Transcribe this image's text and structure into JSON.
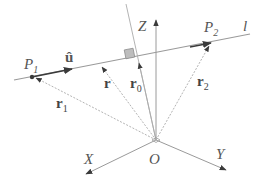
{
  "diagram": {
    "type": "vector-geometry",
    "colors": {
      "line": "#9a9a9a",
      "arrow": "#3a3a3a",
      "square": "#b0b0b0",
      "text": "#555555"
    },
    "axes": {
      "x": {
        "label": "X"
      },
      "y": {
        "label": "Y"
      },
      "z": {
        "label": "Z"
      },
      "origin": {
        "label": "O"
      }
    },
    "line": {
      "label": "l"
    },
    "points": {
      "p1": {
        "label": "P",
        "sub": "1"
      },
      "p2": {
        "label": "P",
        "sub": "2"
      }
    },
    "vectors": {
      "u_hat": {
        "label": "û"
      },
      "r": {
        "label": "r"
      },
      "r0": {
        "label": "r",
        "sub": "0"
      },
      "r1": {
        "label": "r",
        "sub": "1"
      },
      "r2": {
        "label": "r",
        "sub": "2"
      }
    }
  }
}
